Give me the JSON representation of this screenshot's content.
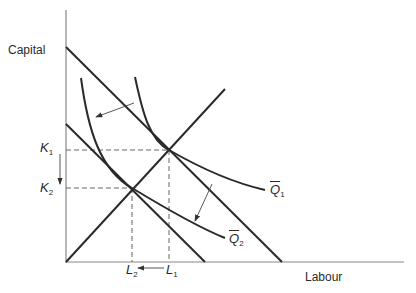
{
  "diagram": {
    "type": "isoquant-isocost",
    "axes": {
      "y_label": "Capital",
      "x_label": "Labour"
    },
    "isoquants": [
      {
        "name": "Q1",
        "label": "Q",
        "sub": "1",
        "bar": true
      },
      {
        "name": "Q2",
        "label": "Q",
        "sub": "2",
        "bar": true
      }
    ],
    "levels": {
      "K1": {
        "label": "K",
        "sub": "1"
      },
      "K2": {
        "label": "K",
        "sub": "2"
      },
      "L1": {
        "label": "L",
        "sub": "1"
      },
      "L2": {
        "label": "L",
        "sub": "2"
      }
    },
    "elements": [
      "upper isocost line",
      "lower isocost line",
      "expansion path through origin",
      "arrow Q1 to Q2 (upper-left)",
      "arrow Q1 to Q2 (lower-right)",
      "arrow K1 down to K2",
      "arrow L1 left to L2"
    ],
    "colors": {
      "line": "#2a2a2a",
      "dashed": "#555555",
      "arrow": "#444444"
    }
  }
}
